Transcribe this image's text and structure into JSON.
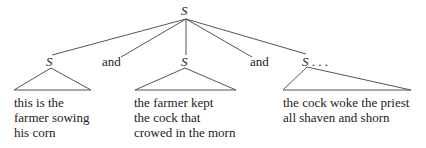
{
  "diagram": {
    "type": "syntax-tree",
    "root": {
      "label": "S"
    },
    "children": [
      {
        "label": "S",
        "leaf_lines": [
          "this is the",
          "farmer sowing",
          "his corn"
        ]
      },
      {
        "label": "and"
      },
      {
        "label": "S",
        "leaf_lines": [
          "the farmer kept",
          "the cock that",
          "crowed in the morn"
        ]
      },
      {
        "label": "and"
      },
      {
        "label": "S",
        "suffix": " . . .",
        "leaf_lines": [
          "the cock woke the priest",
          "all shaven and shorn"
        ]
      }
    ],
    "colors": {
      "line": "#555555",
      "text": "#222222",
      "background": "#ffffff"
    }
  }
}
